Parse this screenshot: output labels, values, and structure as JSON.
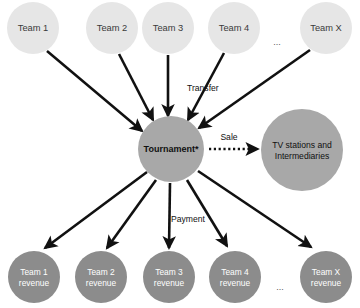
{
  "diagram": {
    "colors": {
      "team_node_fill": "#e6e6e6",
      "team_node_text": "#3a3a3a",
      "tournament_fill": "#a8a8a8",
      "tournament_text": "#1a1a1a",
      "tv_fill": "#a8a8a8",
      "tv_text": "#1a1a1a",
      "revenue_fill": "#8c8c8c",
      "revenue_text": "#ffffff",
      "arrow": "#111111",
      "background": "#ffffff"
    },
    "top_nodes": [
      {
        "id": "team-1",
        "label": "Team 1",
        "cx": 33,
        "cy": 28,
        "r": 26
      },
      {
        "id": "team-2",
        "label": "Team 2",
        "cx": 112,
        "cy": 28,
        "r": 26
      },
      {
        "id": "team-3",
        "label": "Team 3",
        "cx": 168,
        "cy": 28,
        "r": 26
      },
      {
        "id": "team-4",
        "label": "Team 4",
        "cx": 234,
        "cy": 28,
        "r": 26
      },
      {
        "id": "team-x",
        "label": "Team X",
        "cx": 326,
        "cy": 28,
        "r": 26
      }
    ],
    "top_ellipsis": {
      "label": "...",
      "x": 277,
      "y": 45
    },
    "center_node": {
      "id": "tournament",
      "label": "Tournament*",
      "cx": 171,
      "cy": 149,
      "r": 33
    },
    "right_node": {
      "id": "tv-stations",
      "label_line1": "TV stations and",
      "label_line2": "Intermediaries",
      "cx": 302,
      "cy": 150,
      "r": 41
    },
    "bottom_nodes": [
      {
        "id": "team-1-revenue",
        "label_line1": "Team 1",
        "label_line2": "revenue",
        "cx": 34,
        "cy": 277,
        "r": 26
      },
      {
        "id": "team-2-revenue",
        "label_line1": "Team 2",
        "label_line2": "revenue",
        "cx": 101,
        "cy": 277,
        "r": 26
      },
      {
        "id": "team-3-revenue",
        "label_line1": "Team 3",
        "label_line2": "revenue",
        "cx": 169,
        "cy": 277,
        "r": 26
      },
      {
        "id": "team-4-revenue",
        "label_line1": "Team 4",
        "label_line2": "revenue",
        "cx": 235,
        "cy": 277,
        "r": 26
      },
      {
        "id": "team-x-revenue",
        "label_line1": "Team X",
        "label_line2": "revenue",
        "cx": 326,
        "cy": 277,
        "r": 26
      }
    ],
    "bottom_ellipsis": {
      "label": "...",
      "x": 280,
      "y": 288
    },
    "edge_labels": {
      "transfer": {
        "label": "Transfer",
        "x": 187,
        "y": 88
      },
      "sale": {
        "label": "Sale",
        "x": 229,
        "y": 137
      },
      "payment": {
        "label": "Payment",
        "x": 187,
        "y": 219
      }
    },
    "inbound_edges": [
      {
        "from": "team-1",
        "to": "tournament",
        "x1": 47,
        "y1": 51,
        "x2": 142,
        "y2": 131
      },
      {
        "from": "team-2",
        "to": "tournament",
        "x1": 119,
        "y1": 54,
        "x2": 153,
        "y2": 120
      },
      {
        "from": "team-3",
        "to": "tournament",
        "x1": 168,
        "y1": 55,
        "x2": 168,
        "y2": 116
      },
      {
        "from": "team-4",
        "to": "tournament",
        "x1": 224,
        "y1": 53,
        "x2": 188,
        "y2": 120
      },
      {
        "from": "team-x",
        "to": "tournament",
        "x1": 310,
        "y1": 50,
        "x2": 199,
        "y2": 128
      }
    ],
    "outbound_edges": [
      {
        "from": "tournament",
        "to": "team-1-revenue",
        "x1": 147,
        "y1": 172,
        "x2": 45,
        "y2": 248
      },
      {
        "from": "tournament",
        "to": "team-2-revenue",
        "x1": 156,
        "y1": 180,
        "x2": 107,
        "y2": 248
      },
      {
        "from": "tournament",
        "to": "team-3-revenue",
        "x1": 170,
        "y1": 183,
        "x2": 169,
        "y2": 248
      },
      {
        "from": "tournament",
        "to": "team-4-revenue",
        "x1": 187,
        "y1": 180,
        "x2": 227,
        "y2": 246
      },
      {
        "from": "tournament",
        "to": "team-x-revenue",
        "x1": 198,
        "y1": 171,
        "x2": 311,
        "y2": 247
      }
    ],
    "sale_edge": {
      "from": "tournament",
      "to": "tv-stations",
      "x1": 209,
      "y1": 149,
      "x2": 257,
      "y2": 149,
      "style": "dotted"
    }
  }
}
